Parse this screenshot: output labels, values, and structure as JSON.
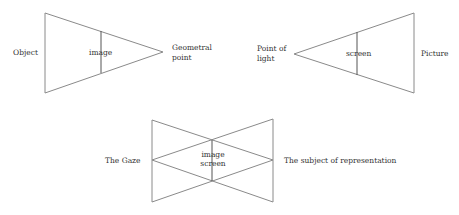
{
  "diagram1": {
    "left_label": "Object",
    "inner_label": "image",
    "right_label_line1": "Geometral",
    "right_label_line2": "point"
  },
  "diagram2": {
    "left_label_line1": "Point of",
    "left_label_line2": "light",
    "inner_label": "screen",
    "right_label": "Picture"
  },
  "diagram3": {
    "left_label": "The Gaze",
    "inner_label_line1": "image",
    "inner_label_line2": "screen",
    "right_label": "The subject of representation"
  },
  "colors": {
    "line": "#8a8a8a",
    "text": "#333333",
    "background": "#ffffff"
  }
}
